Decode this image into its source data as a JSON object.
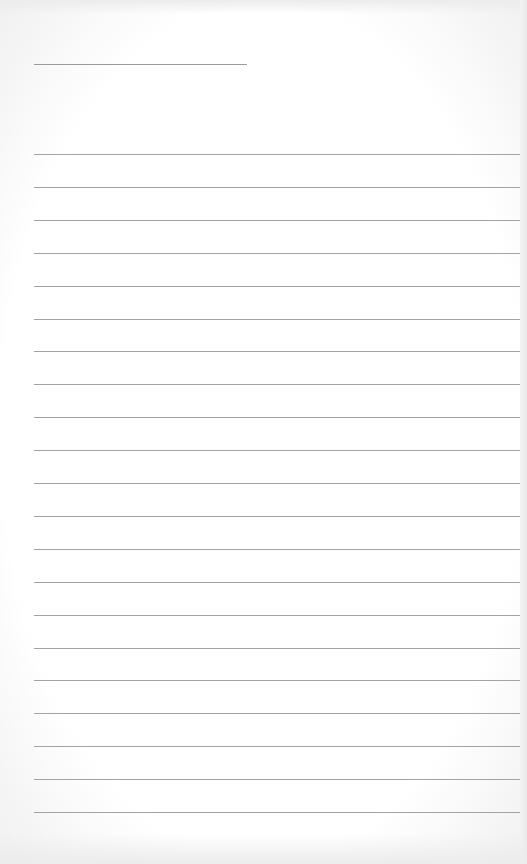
{
  "page": {
    "type": "lined-paper",
    "background_color": "#ffffff",
    "line_color": "#a3a3a3",
    "header_line": {
      "x": 34,
      "y": 64,
      "width": 213
    },
    "rules": {
      "count": 21,
      "first_y": 154,
      "spacing": 32.9,
      "x": 34,
      "width": 486
    }
  }
}
